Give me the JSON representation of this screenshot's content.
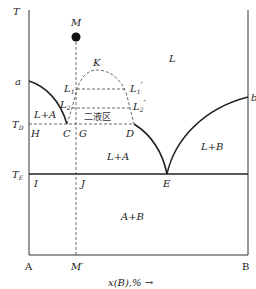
{
  "diagram": {
    "axes": {
      "y_label": "T",
      "x_label": "x(B),%",
      "x_arrow": "→",
      "left_end": "A",
      "right_end": "B",
      "composition_mark": "M′"
    },
    "temperatures": {
      "td_label": "T",
      "td_sub": "D",
      "tx_label": "T",
      "tx_sub": "E"
    },
    "points": {
      "M": "M",
      "K": "K",
      "a": "a",
      "b": "b",
      "C": "C",
      "D": "D",
      "E": "E",
      "G": "G",
      "H": "H",
      "I": "I",
      "J": "J",
      "L1": "L",
      "L1_sub": "1",
      "L2": "L",
      "L2_sub": "2",
      "L1p": "L",
      "L1p_sub": "1",
      "L1p_prime": "′",
      "L2p": "L",
      "L2p_sub": "2",
      "L2p_prime": "′"
    },
    "regions": {
      "liquid": "L",
      "l_plus_a_upper": "L+A",
      "l_plus_a_lower": "L+A",
      "l_plus_b": "L+B",
      "a_plus_b": "A+B",
      "two_liquid": "二液区"
    },
    "colors": {
      "line": "#222222",
      "dashed": "#444444",
      "background": "#ffffff"
    }
  }
}
